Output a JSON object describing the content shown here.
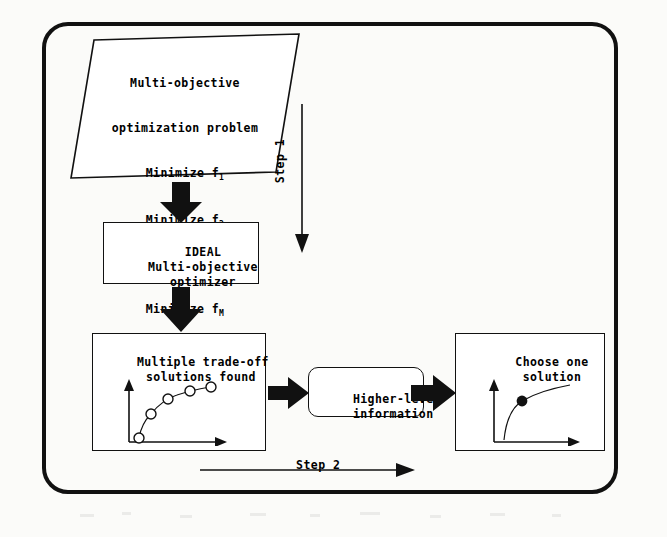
{
  "diagram": {
    "background_color": "#fbfbf9",
    "line_color": "#111111",
    "frame": {
      "shape": "rounded-rectangle"
    },
    "nodes": {
      "problem": {
        "shape": "parallelogram",
        "lines": [
          "Multi-objective",
          "optimization problem",
          "Minimize f",
          "Minimize f",
          ".....",
          "Minimize f",
          "subject to constraints"
        ],
        "line1": "Multi-objective",
        "line2": "optimization problem",
        "min1_text": "Minimize f",
        "min1_sub": "1",
        "min2_text": "Minimize f",
        "min2_sub": "2",
        "ellipsis": ".....",
        "minM_text": "Minimize f",
        "minM_sub": "M",
        "constraints": "subject to constraints"
      },
      "optimizer": {
        "shape": "rectangle",
        "line1": "IDEAL",
        "line2": "Multi-objective",
        "line3": "optimizer"
      },
      "tradeoff": {
        "shape": "rectangle",
        "line1": "Multiple trade-off",
        "line2": "solutions found",
        "plot": {
          "type": "scatter-line",
          "marker": "open-circle",
          "point_count": 5,
          "axes": "two-arrow-L"
        }
      },
      "information": {
        "shape": "rounded-rectangle",
        "line1": "Higher-level",
        "line2": "information"
      },
      "choose": {
        "shape": "rectangle",
        "line1": "Choose one",
        "line2": "solution",
        "plot": {
          "type": "line-with-point",
          "marker": "filled-circle",
          "point_count": 1,
          "axes": "two-arrow-L"
        }
      }
    },
    "annotations": {
      "step1": "Step 1",
      "step2": "Step 2"
    },
    "arrows": {
      "problem_to_optimizer": "down-block-arrow",
      "optimizer_to_tradeoff": "down-block-arrow",
      "tradeoff_to_information": "right-block-arrow",
      "information_to_choose": "right-block-arrow",
      "step1_arrow": "thin-down-arrow",
      "step2_arrow": "thin-right-arrow"
    }
  }
}
